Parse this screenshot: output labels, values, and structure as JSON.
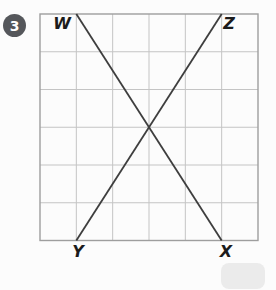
{
  "problem": {
    "number": "3",
    "badge_color": "#55575b"
  },
  "figure": {
    "grid": {
      "cols": 6,
      "rows": 6,
      "line_color": "#c4c4c4",
      "border_color": "#9e9e9e"
    },
    "segment_color": "#3e3e3e",
    "segments": [
      {
        "name": "WX",
        "from": {
          "col": 1,
          "row": 0
        },
        "to": {
          "col": 5,
          "row": 6
        }
      },
      {
        "name": "ZY",
        "from": {
          "col": 5,
          "row": 0
        },
        "to": {
          "col": 1,
          "row": 6
        }
      }
    ],
    "labels": {
      "top_left": "W",
      "top_right": "Z",
      "bottom_left": "Y",
      "bottom_right": "X"
    }
  }
}
